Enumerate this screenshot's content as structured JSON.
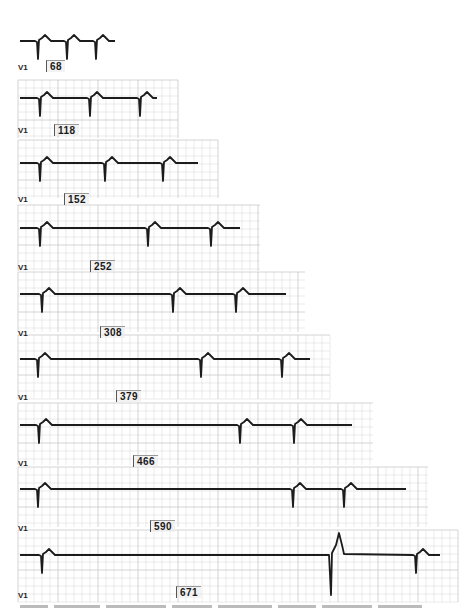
{
  "figure": {
    "lead_label": "V1",
    "grid_color": "#c9c9c9",
    "trace_color": "#1c1c1c",
    "strips": [
      {
        "label": "V1",
        "count": "68",
        "top": 8,
        "height": 62,
        "width": 118,
        "baseline": 33,
        "label_x": 18,
        "label_y": 63,
        "box_x": 46,
        "box_y": 60,
        "grid": false,
        "beats": [
          {
            "x": 38,
            "type": "n"
          },
          {
            "x": 67,
            "type": "n"
          },
          {
            "x": 96,
            "type": "n"
          }
        ],
        "start": 20,
        "end": 115
      },
      {
        "label": "V1",
        "count": "118",
        "top": 80,
        "height": 58,
        "width": 160,
        "baseline": 18,
        "label_x": 18,
        "label_y": 126,
        "box_x": 54,
        "box_y": 124,
        "grid": true,
        "beats": [
          {
            "x": 40,
            "type": "n"
          },
          {
            "x": 90,
            "type": "n"
          },
          {
            "x": 140,
            "type": "n"
          }
        ],
        "start": 20,
        "end": 157
      },
      {
        "label": "V1",
        "count": "152",
        "top": 140,
        "height": 58,
        "width": 200,
        "baseline": 23,
        "label_x": 18,
        "label_y": 195,
        "box_x": 64,
        "box_y": 193,
        "grid": true,
        "beats": [
          {
            "x": 40,
            "type": "n"
          },
          {
            "x": 105,
            "type": "n"
          },
          {
            "x": 163,
            "type": "n"
          }
        ],
        "start": 20,
        "end": 198
      },
      {
        "label": "V1",
        "count": "252",
        "top": 205,
        "height": 66,
        "width": 242,
        "baseline": 23,
        "label_x": 18,
        "label_y": 263,
        "box_x": 90,
        "box_y": 260,
        "grid": true,
        "beats": [
          {
            "x": 40,
            "type": "n"
          },
          {
            "x": 148,
            "type": "n"
          },
          {
            "x": 211,
            "type": "n"
          }
        ],
        "start": 20,
        "end": 240
      },
      {
        "label": "V1",
        "count": "308",
        "top": 272,
        "height": 60,
        "width": 287,
        "baseline": 22,
        "label_x": 18,
        "label_y": 329,
        "box_x": 100,
        "box_y": 326,
        "grid": true,
        "beats": [
          {
            "x": 42,
            "type": "n"
          },
          {
            "x": 173,
            "type": "n"
          },
          {
            "x": 236,
            "type": "n"
          }
        ],
        "start": 20,
        "end": 286
      },
      {
        "label": "V1",
        "count": "379",
        "top": 335,
        "height": 64,
        "width": 312,
        "baseline": 24,
        "label_x": 18,
        "label_y": 393,
        "box_x": 116,
        "box_y": 390,
        "grid": true,
        "beats": [
          {
            "x": 38,
            "type": "n"
          },
          {
            "x": 201,
            "type": "n"
          },
          {
            "x": 282,
            "type": "n"
          }
        ],
        "start": 20,
        "end": 310
      },
      {
        "label": "V1",
        "count": "466",
        "top": 403,
        "height": 62,
        "width": 355,
        "baseline": 22,
        "label_x": 18,
        "label_y": 459,
        "box_x": 133,
        "box_y": 455,
        "grid": true,
        "beats": [
          {
            "x": 39,
            "type": "n"
          },
          {
            "x": 240,
            "type": "n"
          },
          {
            "x": 294,
            "type": "n"
          }
        ],
        "start": 20,
        "end": 352
      },
      {
        "label": "V1",
        "count": "590",
        "top": 467,
        "height": 60,
        "width": 410,
        "baseline": 22,
        "label_x": 18,
        "label_y": 524,
        "box_x": 150,
        "box_y": 520,
        "grid": true,
        "beats": [
          {
            "x": 38,
            "type": "n"
          },
          {
            "x": 293,
            "type": "n"
          },
          {
            "x": 344,
            "type": "n"
          }
        ],
        "start": 20,
        "end": 406
      },
      {
        "label": "V1",
        "count": "671",
        "top": 530,
        "height": 72,
        "width": 440,
        "baseline": 25,
        "label_x": 18,
        "label_y": 591,
        "box_x": 176,
        "box_y": 586,
        "grid": true,
        "beats": [
          {
            "x": 42,
            "type": "n"
          },
          {
            "x": 331,
            "type": "v"
          },
          {
            "x": 416,
            "type": "n"
          }
        ],
        "start": 20,
        "end": 440
      }
    ]
  },
  "caption": {
    "visible": "partially cut off"
  }
}
